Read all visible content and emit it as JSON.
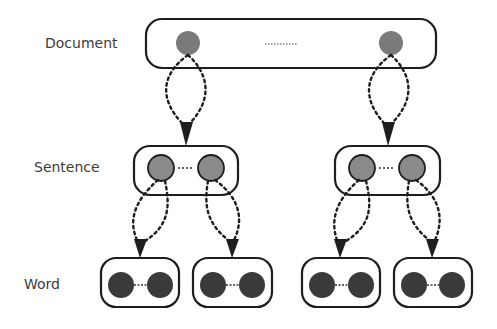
{
  "diagram": {
    "type": "hierarchy",
    "levels": [
      {
        "id": "document",
        "label": "Document",
        "y": 43
      },
      {
        "id": "sentence",
        "label": "Sentence",
        "y": 168
      },
      {
        "id": "word",
        "label": "Word",
        "y": 285
      }
    ],
    "document_ellipsis": "..........",
    "colors": {
      "document_node": "#7a7a7a",
      "sentence_node": "#8a8a8a",
      "word_node": "#3a3a3a",
      "stroke": "#1e1e1e",
      "label": "#3c3c3c"
    },
    "structure": {
      "document": {
        "nodes": 2,
        "children": [
          "sentence-1",
          "sentence-2"
        ]
      },
      "sentence-1": {
        "nodes": 2,
        "children": [
          "word-1",
          "word-2"
        ]
      },
      "sentence-2": {
        "nodes": 2,
        "children": [
          "word-3",
          "word-4"
        ]
      },
      "word-1": {
        "nodes": 2
      },
      "word-2": {
        "nodes": 2
      },
      "word-3": {
        "nodes": 2
      },
      "word-4": {
        "nodes": 2
      }
    }
  }
}
